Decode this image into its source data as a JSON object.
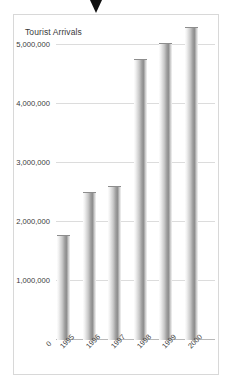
{
  "cursor": {
    "icon": "triangle-down-marker",
    "color": "#111111"
  },
  "chart_data": {
    "type": "bar",
    "title": "Tourist Arrivals",
    "xlabel": "",
    "ylabel": "",
    "categories": [
      "1995",
      "1996",
      "1997",
      "1998",
      "1999",
      "2000"
    ],
    "values": [
      1760000,
      2490000,
      2600000,
      4740000,
      5010000,
      5280000
    ],
    "ylim": [
      0,
      5700000
    ],
    "yticks": [
      0,
      1000000,
      2000000,
      3000000,
      4000000,
      5000000
    ],
    "ytick_labels": [
      "0",
      "1,000,000",
      "2,000,000",
      "3,000,000",
      "4,000,000",
      "5,000,000"
    ],
    "grid": true,
    "legend": "none",
    "bar_color": "#9a9a9a",
    "grid_color": "#dcdcdc",
    "axis_color": "#b9b9b9",
    "text_color": "#3a3a3a",
    "frame_color": "#d8d8d8",
    "background": "#ffffff"
  }
}
